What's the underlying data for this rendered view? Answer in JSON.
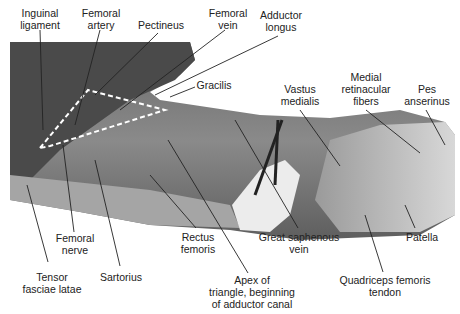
{
  "figure": {
    "labels": {
      "inguinal_ligament": "Inguinal\nligament",
      "femoral_artery": "Femoral\nartery",
      "pectineus": "Pectineus",
      "femoral_vein": "Femoral\nvein",
      "adductor_longus": "Adductor\nlongus",
      "gracilis": "Gracilis",
      "vastus_medialis": "Vastus\nmedialis",
      "medial_retinacular_fibers": "Medial\nretinacular\nfibers",
      "pes_anserinus": "Pes\nanserinus",
      "femoral_nerve": "Femoral\nnerve",
      "tensor_fasciae_latae": "Tensor\nfasciae latae",
      "sartorius": "Sartorius",
      "rectus_femoris": "Rectus\nfemoris",
      "apex": "Apex of\ntriangle, beginning\nof adductor canal",
      "great_saphenous_vein": "Great saphenous\nvein",
      "patella": "Patella",
      "quadriceps_tendon": "Quadriceps femoris\ntendon"
    }
  }
}
